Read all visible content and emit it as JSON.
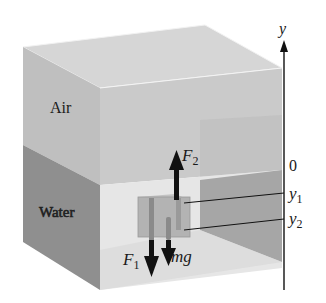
{
  "diagram": {
    "regions": {
      "air_label": "Air",
      "water_label": "Water"
    },
    "forces": {
      "upward": {
        "label": "F",
        "subscript": "2"
      },
      "downward_pressure": {
        "label": "F",
        "subscript": "1"
      },
      "weight": {
        "label": "mg"
      }
    },
    "axis": {
      "name": "y",
      "origin_label": "0",
      "marks": [
        {
          "label": "y",
          "subscript": "1"
        },
        {
          "label": "y",
          "subscript": "2"
        }
      ]
    },
    "colors": {
      "air_front": "#c9c9c9",
      "air_top": "#d3d3d3",
      "air_left": "#bdbdbd",
      "water_front": "#e8e8e8",
      "water_left": "#8e8e8e",
      "back_wall_water": "#a8a8a8",
      "block": "#b5b5b5",
      "arrow": "#111111"
    }
  }
}
